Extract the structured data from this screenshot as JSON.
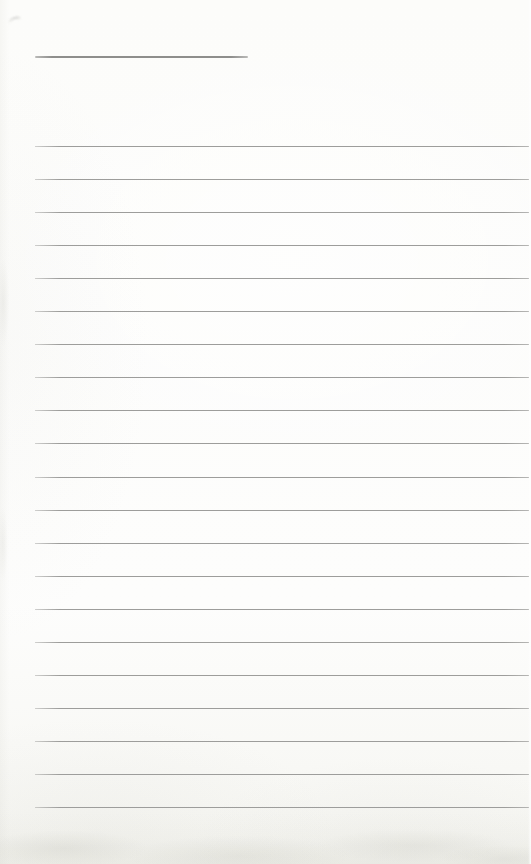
{
  "page": {
    "width": 531,
    "height": 864,
    "kind": "blank-ruled-page",
    "text_content": ""
  },
  "colors": {
    "paper": "#fcfcfa",
    "rule_line": "#9d9d9b",
    "title_line": "#8e8e8c",
    "bottom_shade": "#e4e4dd",
    "smudge": "#b5b5b2"
  },
  "title_underline": {
    "x": 35,
    "y": 56,
    "width": 213,
    "thickness": 2
  },
  "ruled_lines": {
    "count": 21,
    "x": 35,
    "width": 494,
    "top_y": 146,
    "spacing": 33.05,
    "thickness": 1
  },
  "smudge_mark": {
    "x": 9,
    "y": 17,
    "width": 12,
    "height": 7,
    "border_thickness": 2
  },
  "bottom_shading": {
    "height": 52
  }
}
